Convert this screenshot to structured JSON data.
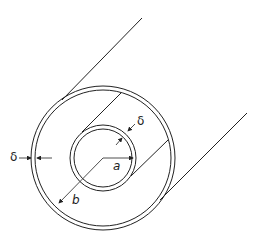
{
  "diagram": {
    "labels": {
      "delta_outer": "δ",
      "delta_inner": "δ",
      "inner_radius": "a",
      "outer_radius": "b"
    },
    "colors": {
      "stroke": "#222222",
      "background": "#ffffff"
    }
  }
}
